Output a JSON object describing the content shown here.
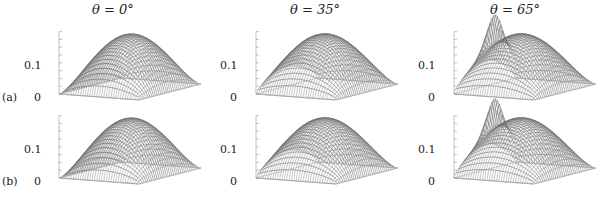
{
  "chart_data": {
    "type": "surface",
    "columns": [
      {
        "title": "θ = 0°",
        "theta_deg": 0
      },
      {
        "title": "θ = 35°",
        "theta_deg": 35
      },
      {
        "title": "θ = 65°",
        "theta_deg": 65
      }
    ],
    "rows": [
      {
        "label": "(a)"
      },
      {
        "label": "(b)"
      }
    ],
    "z_ticks": [
      "0",
      "0.1"
    ],
    "zlim": [
      0,
      0.17
    ],
    "peak_value_approx": 0.15,
    "side_spike_approx": {
      "(a)": 0.17,
      "(b)": 0.17
    }
  },
  "titles": [
    "θ = 0°",
    "θ = 35°",
    "θ = 65°"
  ],
  "row_labels": [
    "(a)",
    "(b)"
  ],
  "tick_top": "0.1",
  "tick_bottom": "0"
}
